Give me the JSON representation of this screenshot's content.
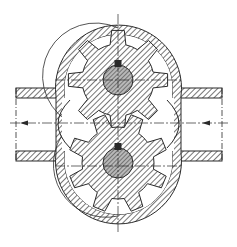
{
  "diagram": {
    "type": "external gear pump cross-section",
    "colors": {
      "background": "#ffffff",
      "ink": "#2a2a2a",
      "hatch_fill": "#9a9a9a",
      "hub_fill": "#8c8c8c"
    },
    "gears": [
      {
        "name": "upper-gear",
        "cx": 118,
        "cy": 80,
        "outer_r": 50,
        "root_r": 36,
        "hub_r": 15,
        "teeth": 8,
        "phase_deg": 0
      },
      {
        "name": "lower-gear",
        "cx": 118,
        "cy": 163,
        "outer_r": 50,
        "root_r": 36,
        "hub_r": 15,
        "teeth": 8,
        "phase_deg": 22.5
      }
    ],
    "flow": {
      "inlet_side": "right",
      "outlet_side": "left",
      "arrows": [
        {
          "name": "outlet-arrow",
          "x": 22,
          "y": 123,
          "direction": "left"
        },
        {
          "name": "inlet-arrow",
          "x": 205,
          "y": 123,
          "direction": "left"
        }
      ]
    }
  }
}
